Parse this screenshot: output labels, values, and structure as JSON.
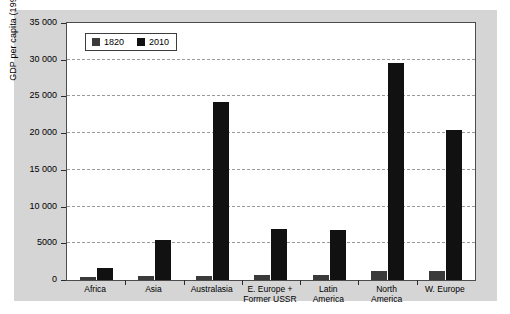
{
  "chart_data": {
    "type": "bar",
    "title": "",
    "xlabel": "",
    "ylabel": "GDP per capita (1990 $)",
    "ylim": [
      0,
      35000
    ],
    "yticks": [
      0,
      5000,
      10000,
      15000,
      20000,
      25000,
      30000,
      35000
    ],
    "ytick_labels": [
      "0",
      "5000",
      "10 000",
      "15 000",
      "20 000",
      "25 000",
      "30 000",
      "35 000"
    ],
    "grid": true,
    "legend_position": "top-left",
    "categories": [
      "Africa",
      "Asia",
      "Australasia",
      "E. Europe +\nFormer USSR",
      "Latin\nAmerica",
      "North\nAmerica",
      "W. Europe"
    ],
    "series": [
      {
        "name": "1820",
        "color": "#3a3a3a",
        "values": [
          420,
          600,
          520,
          690,
          700,
          1250,
          1200
        ]
      },
      {
        "name": "2010",
        "color": "#111111",
        "values": [
          1650,
          5500,
          24200,
          6900,
          6800,
          29600,
          20400
        ]
      }
    ]
  },
  "legend": {
    "items": [
      {
        "label": "1820"
      },
      {
        "label": "2010"
      }
    ]
  }
}
